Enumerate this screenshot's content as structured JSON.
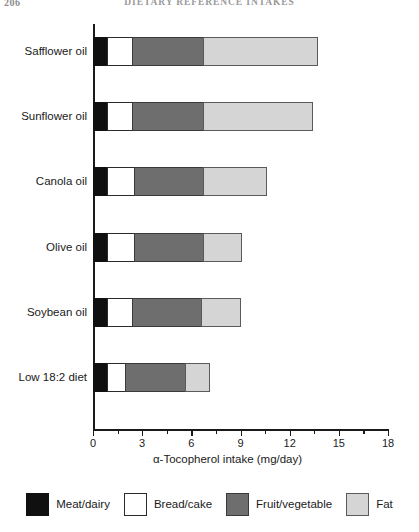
{
  "page": {
    "number": "206",
    "running_title": "DIETARY REFERENCE INTAKES"
  },
  "chart_data": {
    "type": "bar",
    "orientation": "horizontal",
    "stacked": true,
    "title": "",
    "xlabel": "α-Tocopherol intake (mg/day)",
    "ylabel": "",
    "xlim": [
      0,
      18
    ],
    "xticks": [
      0,
      3,
      6,
      9,
      12,
      15,
      18
    ],
    "xtick_labels": [
      "0",
      "3",
      "6",
      "9",
      "12",
      "15",
      "18"
    ],
    "minor_tick_interval": 1.5,
    "grid": false,
    "legend_position": "bottom",
    "categories": [
      "Safflower oil",
      "Sunflower oil",
      "Canola oil",
      "Olive oil",
      "Soybean oil",
      "Low 18:2 diet"
    ],
    "series": [
      {
        "name": "Meat/dairy",
        "color": "#101010",
        "values": [
          0.9,
          0.9,
          0.9,
          0.9,
          0.9,
          0.9
        ]
      },
      {
        "name": "Bread/cake",
        "color": "#ffffff",
        "values": [
          1.6,
          1.6,
          1.7,
          1.7,
          1.6,
          1.2
        ]
      },
      {
        "name": "Fruit/vegetable",
        "color": "#6e6e6e",
        "values": [
          4.4,
          4.4,
          4.3,
          4.3,
          4.3,
          3.7
        ]
      },
      {
        "name": "Fat",
        "color": "#d5d5d5",
        "values": [
          7.0,
          6.7,
          3.9,
          2.4,
          2.4,
          1.5
        ]
      }
    ],
    "totals": [
      13.9,
      13.6,
      10.8,
      9.3,
      9.2,
      7.3
    ],
    "bars": [
      {
        "category": "Safflower oil",
        "segments": [
          {
            "name": "Meat/dairy",
            "start": 0,
            "end": 0.9
          },
          {
            "name": "Bread/cake",
            "start": 0.9,
            "end": 2.5
          },
          {
            "name": "Fruit/vegetable",
            "start": 2.5,
            "end": 6.9
          },
          {
            "name": "Fat",
            "start": 6.9,
            "end": 13.9
          }
        ],
        "total": 13.9
      },
      {
        "category": "Sunflower oil",
        "segments": [
          {
            "name": "Meat/dairy",
            "start": 0,
            "end": 0.9
          },
          {
            "name": "Bread/cake",
            "start": 0.9,
            "end": 2.5
          },
          {
            "name": "Fruit/vegetable",
            "start": 2.5,
            "end": 6.9
          },
          {
            "name": "Fat",
            "start": 6.9,
            "end": 13.6
          }
        ],
        "total": 13.6
      },
      {
        "category": "Canola oil",
        "segments": [
          {
            "name": "Meat/dairy",
            "start": 0,
            "end": 0.9
          },
          {
            "name": "Bread/cake",
            "start": 0.9,
            "end": 2.6
          },
          {
            "name": "Fruit/vegetable",
            "start": 2.6,
            "end": 6.9
          },
          {
            "name": "Fat",
            "start": 6.9,
            "end": 10.8
          }
        ],
        "total": 10.8
      },
      {
        "category": "Olive oil",
        "segments": [
          {
            "name": "Meat/dairy",
            "start": 0,
            "end": 0.9
          },
          {
            "name": "Bread/cake",
            "start": 0.9,
            "end": 2.6
          },
          {
            "name": "Fruit/vegetable",
            "start": 2.6,
            "end": 6.9
          },
          {
            "name": "Fat",
            "start": 6.9,
            "end": 9.3
          }
        ],
        "total": 9.3
      },
      {
        "category": "Soybean oil",
        "segments": [
          {
            "name": "Meat/dairy",
            "start": 0,
            "end": 0.9
          },
          {
            "name": "Bread/cake",
            "start": 0.9,
            "end": 2.5
          },
          {
            "name": "Fruit/vegetable",
            "start": 2.5,
            "end": 6.8
          },
          {
            "name": "Fat",
            "start": 6.8,
            "end": 9.2
          }
        ],
        "total": 9.2
      },
      {
        "category": "Low 18:2 diet",
        "segments": [
          {
            "name": "Meat/dairy",
            "start": 0,
            "end": 0.9
          },
          {
            "name": "Bread/cake",
            "start": 0.9,
            "end": 2.1
          },
          {
            "name": "Fruit/vegetable",
            "start": 2.1,
            "end": 5.8
          },
          {
            "name": "Fat",
            "start": 5.8,
            "end": 7.3
          }
        ],
        "total": 7.3
      }
    ],
    "legend": [
      {
        "label": "Meat/dairy",
        "color": "#101010"
      },
      {
        "label": "Bread/cake",
        "color": "#ffffff"
      },
      {
        "label": "Fruit/vegetable",
        "color": "#6e6e6e"
      },
      {
        "label": "Fat",
        "color": "#d5d5d5"
      }
    ]
  }
}
